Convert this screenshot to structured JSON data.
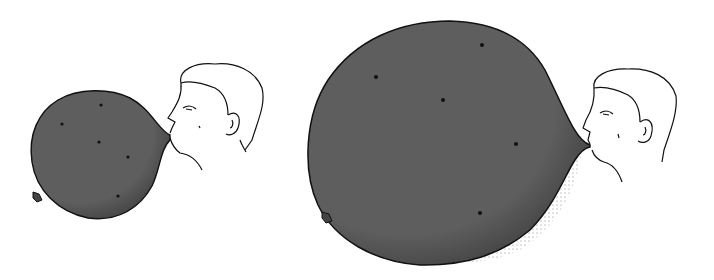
{
  "scene": {
    "description": "Two illustrations of a man blowing up a balloon with dots on it; the dots spread farther apart as the balloon inflates",
    "colors": {
      "background": "#ffffff",
      "balloon": "#5e5e5e",
      "outline": "#111111",
      "dot": "#111111"
    },
    "panels": [
      {
        "name": "small-balloon",
        "balloon": {
          "cx": 98,
          "cy": 150,
          "rx": 66,
          "ry": 58
        },
        "dots": [
          [
            62,
            124
          ],
          [
            101,
            105
          ],
          [
            99,
            142
          ],
          [
            128,
            157
          ],
          [
            118,
            196
          ]
        ]
      },
      {
        "name": "large-balloon",
        "balloon": {
          "cx": 440,
          "cy": 142,
          "rx": 134,
          "ry": 122
        },
        "dots": [
          [
            482,
            45
          ],
          [
            376,
            77
          ],
          [
            443,
            100
          ],
          [
            516,
            144
          ],
          [
            480,
            213
          ]
        ]
      }
    ]
  }
}
